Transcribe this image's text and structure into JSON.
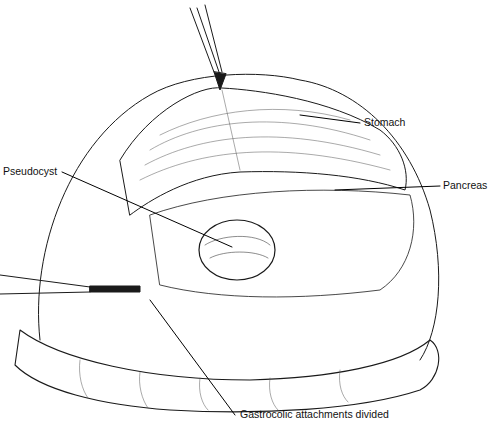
{
  "figure": {
    "labels": {
      "stomach": "Stomach",
      "pancreas": "Pancreas",
      "pseudocyst": "Pseudocyst",
      "gastrocolic": "Gastrocolic attachments divided"
    },
    "colors": {
      "ink": "#111111",
      "background": "#ffffff"
    }
  }
}
